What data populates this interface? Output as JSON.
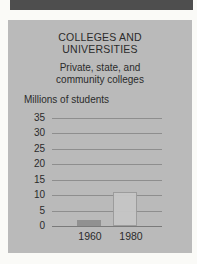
{
  "window": {
    "width": 197,
    "height": 264
  },
  "colors": {
    "page_bg": "#fafaf7",
    "strip": "#4e4e4e",
    "panel_bg": "#bababa",
    "text": "#2b2b2b",
    "gridline": "#8e8e8e",
    "axis_line": "#7a7a7a",
    "bar_1960": "#919191",
    "bar_1980": "#c6c6c6",
    "bar_1980_border": "#9b9b9b"
  },
  "chart_data": {
    "type": "bar",
    "title": "COLLEGES AND UNIVERSITIES",
    "title_lines": [
      "COLLEGES AND",
      "UNIVERSITIES"
    ],
    "subtitle": "Private, state, and community colleges",
    "subtitle_lines": [
      "Private, state, and",
      "community colleges"
    ],
    "ylabel": "Millions of students",
    "xlabel": "",
    "categories": [
      "1960",
      "1980"
    ],
    "values": [
      2,
      11
    ],
    "ylim": [
      0,
      35
    ],
    "yticks": [
      35,
      30,
      25,
      20,
      15,
      10,
      5,
      0
    ],
    "grid": true,
    "legend": "none"
  }
}
